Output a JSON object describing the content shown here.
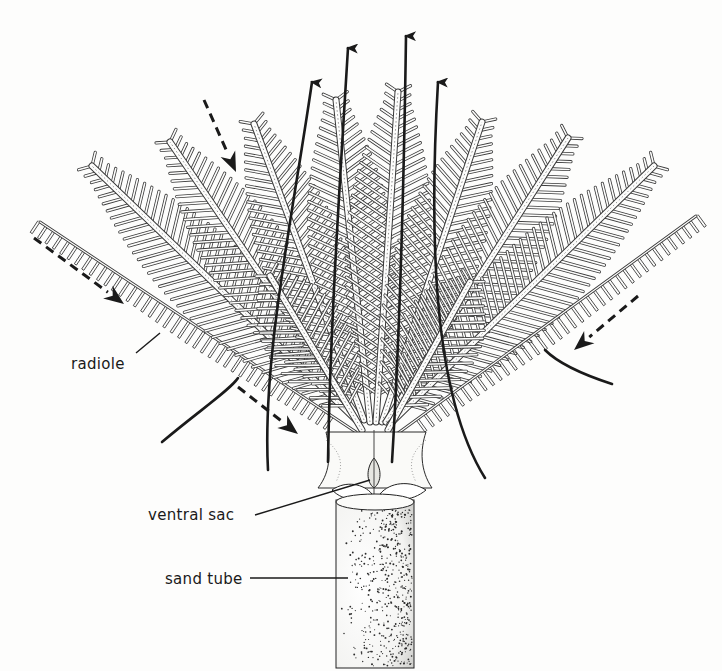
{
  "labels": {
    "radiole": "radiole",
    "ventral_sac": "ventral sac",
    "sand_tube": "sand tube"
  },
  "colors": {
    "ink": "#1a1a1a",
    "frond": "#3a3a3a",
    "paper": "#fdfdfc",
    "stipple": "#2b2b2b"
  },
  "arrows": {
    "solid_outflow": [
      {
        "name": "exhalant-arrow-1",
        "d": "M 268 470 C 262 360 292 220 312 82"
      },
      {
        "name": "exhalant-arrow-2",
        "d": "M 328 462 C 330 330 340 180 348 48"
      },
      {
        "name": "exhalant-arrow-3",
        "d": "M 392 462 C 400 330 404 180 406 36"
      },
      {
        "name": "exhalant-arrow-4",
        "d": "M 485 478 C 430 390 430 220 438 82"
      },
      {
        "name": "exhalant-arrow-left-low",
        "d": "M 162 442 C 200 410 230 390 238 378"
      },
      {
        "name": "exhalant-arrow-right-low",
        "d": "M 612 384 C 575 372 555 360 545 350"
      }
    ],
    "dashed_inflow": [
      {
        "name": "inhalant-arrow-top",
        "x1": 204,
        "y1": 100,
        "x2": 236,
        "y2": 172
      },
      {
        "name": "inhalant-arrow-left",
        "x1": 34,
        "y1": 238,
        "x2": 124,
        "y2": 304
      },
      {
        "name": "inhalant-arrow-lower-left",
        "x1": 238,
        "y1": 387,
        "x2": 298,
        "y2": 434
      },
      {
        "name": "inhalant-arrow-right",
        "x1": 638,
        "y1": 296,
        "x2": 574,
        "y2": 350
      }
    ]
  },
  "radioles": [
    {
      "name": "radiole-far-left",
      "x1": 356,
      "y1": 432,
      "x2": 40,
      "y2": 222,
      "type": "short"
    },
    {
      "name": "radiole-left-1",
      "x1": 356,
      "y1": 420,
      "x2": 92,
      "y2": 166,
      "type": "long"
    },
    {
      "name": "radiole-left-2",
      "x1": 360,
      "y1": 420,
      "x2": 170,
      "y2": 142,
      "type": "long"
    },
    {
      "name": "radiole-left-3",
      "x1": 364,
      "y1": 420,
      "x2": 254,
      "y2": 124,
      "type": "long"
    },
    {
      "name": "radiole-center-left",
      "x1": 370,
      "y1": 422,
      "x2": 336,
      "y2": 100,
      "type": "long"
    },
    {
      "name": "radiole-center",
      "x1": 376,
      "y1": 422,
      "x2": 398,
      "y2": 92,
      "type": "long"
    },
    {
      "name": "radiole-center-right",
      "x1": 382,
      "y1": 422,
      "x2": 482,
      "y2": 122,
      "type": "long"
    },
    {
      "name": "radiole-right-3",
      "x1": 386,
      "y1": 422,
      "x2": 568,
      "y2": 138,
      "type": "long"
    },
    {
      "name": "radiole-right-2",
      "x1": 390,
      "y1": 424,
      "x2": 654,
      "y2": 166,
      "type": "long"
    },
    {
      "name": "radiole-far-right",
      "x1": 394,
      "y1": 436,
      "x2": 696,
      "y2": 216,
      "type": "short"
    },
    {
      "name": "radiole-inner-left",
      "x1": 362,
      "y1": 430,
      "x2": 270,
      "y2": 276,
      "type": "long"
    },
    {
      "name": "radiole-inner-right",
      "x1": 388,
      "y1": 430,
      "x2": 470,
      "y2": 282,
      "type": "long"
    }
  ],
  "tube": {
    "x": 336,
    "y": 500,
    "width": 78,
    "height": 168
  }
}
